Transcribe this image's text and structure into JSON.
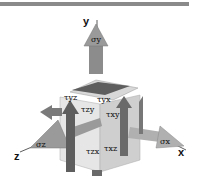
{
  "diagram": {
    "title_bar": {
      "color": "#8a8a8a"
    },
    "axes": {
      "y": {
        "label": "y"
      },
      "x": {
        "label": "x"
      },
      "z": {
        "label": "z"
      }
    },
    "normal_stresses": {
      "y": {
        "label": "σy"
      },
      "x": {
        "label": "σx"
      },
      "z": {
        "label": "σz"
      }
    },
    "shear_stresses": [
      {
        "id": "tau_yz_top",
        "label": "τyz"
      },
      {
        "id": "tau_yx_top",
        "label": "τyx"
      },
      {
        "id": "tau_zy",
        "label": "τzy"
      },
      {
        "id": "tau_xy",
        "label": "τxy"
      },
      {
        "id": "tau_zx",
        "label": "τzx"
      },
      {
        "id": "tau_xz",
        "label": "τxz"
      }
    ],
    "colors": {
      "cube_light": "#e6e6e6",
      "cube_mid": "#cfcfcf",
      "cube_dark": "#b5b5b5",
      "arrow_dark": "#5e5e5e",
      "arrow_mid": "#8c8c8c",
      "arrow_light": "#a8a8a8"
    }
  }
}
